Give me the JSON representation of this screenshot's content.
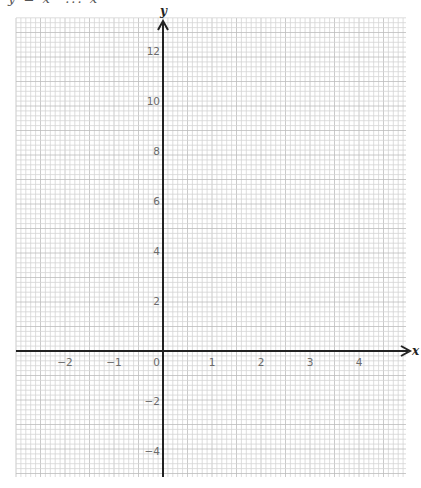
{
  "page": {
    "top_fragment": "y = x² ... x"
  },
  "chart_data": {
    "type": "line",
    "title": "",
    "xlabel": "x",
    "ylabel": "y",
    "xlim": [
      -3.0,
      4.9
    ],
    "ylim": [
      -5.0,
      13.3
    ],
    "grid": true,
    "series": [],
    "x_ticks": [
      {
        "value": -2,
        "label": "−2"
      },
      {
        "value": -1,
        "label": "−1"
      },
      {
        "value": 0,
        "label": "0"
      },
      {
        "value": 1,
        "label": "1"
      },
      {
        "value": 2,
        "label": "2"
      },
      {
        "value": 3,
        "label": "3"
      },
      {
        "value": 4,
        "label": "4"
      }
    ],
    "y_ticks": [
      {
        "value": -4,
        "label": "−4"
      },
      {
        "value": -2,
        "label": "−2"
      },
      {
        "value": 2,
        "label": "2"
      },
      {
        "value": 4,
        "label": "4"
      },
      {
        "value": 6,
        "label": "6"
      },
      {
        "value": 8,
        "label": "8"
      },
      {
        "value": 10,
        "label": "10"
      },
      {
        "value": 12,
        "label": "12"
      }
    ],
    "layout": {
      "origin_px": [
        163,
        351
      ],
      "unit_x_px": 49,
      "unit_y_px": 25,
      "grid_left": 16,
      "grid_right": 406,
      "grid_top": 18,
      "grid_bottom": 477,
      "minor_cell_px": 4.9
    },
    "colors": {
      "grid_minor": "#d4d4d4",
      "grid_major": "#bdbdbd",
      "axis": "#222222",
      "tick_label": "#6a6a6a"
    }
  }
}
